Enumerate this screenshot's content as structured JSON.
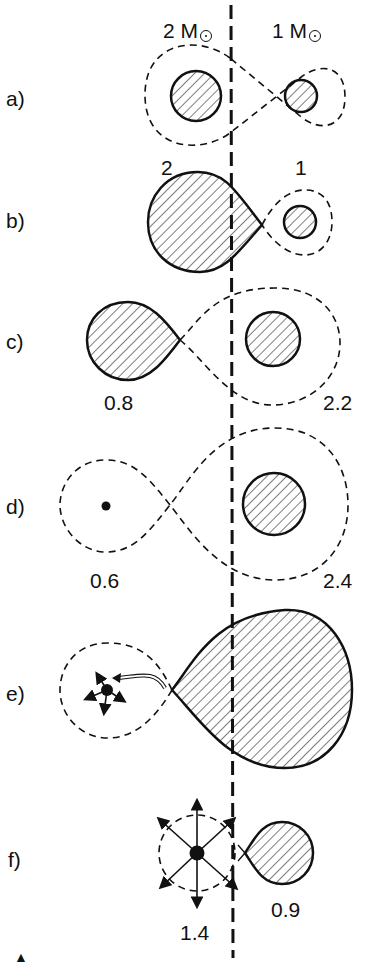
{
  "header": {
    "left_star_mass": "2 M",
    "right_star_mass": "1 M",
    "solar_symbol": "sun-symbol"
  },
  "panels": [
    {
      "label": "a)",
      "left_value": "2",
      "right_value": "1",
      "description": "Both stars well inside their Roche lobes"
    },
    {
      "label": "b)",
      "left_value": "",
      "right_value": "",
      "description": "Primary fills its Roche lobe, mass transfer begins"
    },
    {
      "label": "c)",
      "left_value": "0.8",
      "right_value": "2.2",
      "description": "Mass ratio reversed"
    },
    {
      "label": "d)",
      "left_value": "0.6",
      "right_value": "2.4",
      "description": "Compact remnant and massive companion"
    },
    {
      "label": "e)",
      "left_value": "",
      "right_value": "",
      "description": "Companion overflows onto compact object (accretion stream)"
    },
    {
      "label": "f)",
      "left_value": "1.4",
      "right_value": "0.9",
      "description": "Explosion of compact object"
    }
  ],
  "footer": {
    "marker": "▲"
  },
  "colors": {
    "ink": "#111111",
    "background": "#ffffff"
  }
}
